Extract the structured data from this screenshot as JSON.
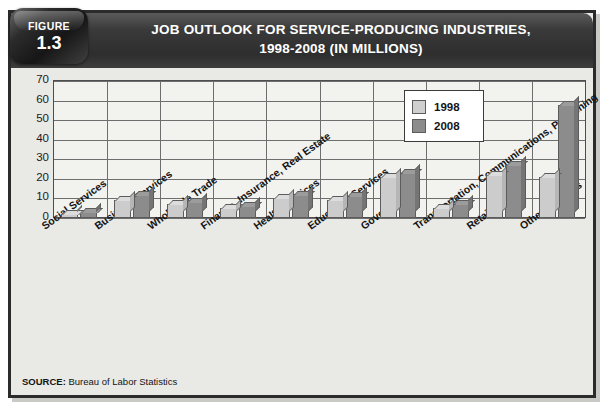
{
  "figure": {
    "badge_label": "FIGURE",
    "badge_number": "1.3",
    "title_line1": "JOB OUTLOOK FOR SERVICE-PRODUCING INDUSTRIES,",
    "title_line2": "1998-2008 (IN MILLIONS)",
    "source_prefix": "SOURCE:",
    "source_text": " Bureau of Labor Statistics"
  },
  "colors": {
    "header_bar": "#2e2e2e",
    "series_1998": "#cccccc",
    "series_2008": "#8c8c8c",
    "frame_border": "#2b2b2b",
    "panel_bg": "#e9e9e6"
  },
  "chart_data": {
    "type": "bar",
    "title": "JOB OUTLOOK FOR SERVICE-PRODUCING INDUSTRIES, 1998-2008 (IN MILLIONS)",
    "xlabel": "",
    "ylabel": "",
    "ylim": [
      0,
      70
    ],
    "ytick_labels": [
      "70",
      "60",
      "50",
      "40",
      "30",
      "20",
      "10",
      "0"
    ],
    "ytick_values": [
      70,
      60,
      50,
      40,
      30,
      20,
      10,
      0
    ],
    "grid": true,
    "legend_position": "upper right",
    "units": "millions of jobs",
    "categories": [
      "Social Services",
      "Business Services",
      "Wholesale Trade",
      "Finance, Insurance, Real Estate",
      "Health Services",
      "Education Services",
      "Government",
      "Transportation, Communications, Publishing",
      "Retail Trade",
      "Other Services"
    ],
    "series": [
      {
        "name": "1998",
        "color": "#cccccc",
        "values": [
          2,
          9,
          7,
          5,
          10,
          9,
          21,
          5,
          22,
          21
        ]
      },
      {
        "name": "2008",
        "color": "#8c8c8c",
        "values": [
          3,
          12,
          8,
          6,
          12,
          11,
          23,
          7,
          27,
          58
        ]
      }
    ]
  }
}
